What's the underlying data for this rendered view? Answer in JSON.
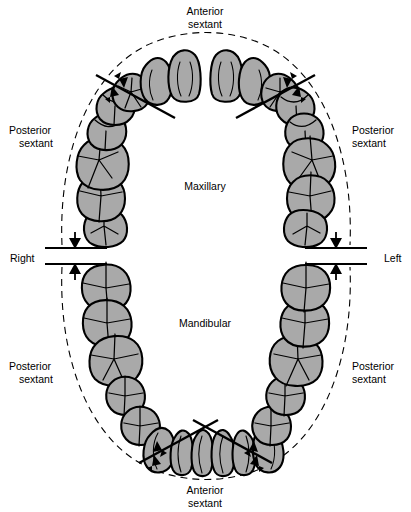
{
  "figure": {
    "title_labels": {
      "top_anterior": "Anterior\nsextant",
      "bottom_anterior": "Anterior\nsextant",
      "maxillary": "Maxillary",
      "mandibular": "Mandibular",
      "right": "Right",
      "left": "Left"
    },
    "labels": {
      "anterior_top_line1": "Anterior",
      "anterior_top_line2": "sextant",
      "anterior_bottom_line1": "Anterior",
      "anterior_bottom_line2": "sextant",
      "maxillary": "Maxillary",
      "mandibular": "Mandibular",
      "right": "Right",
      "left": "Left",
      "post_ul_line1": "Posterior",
      "post_ul_line2": "sextant",
      "post_ur_line1": "Posterior",
      "post_ur_line2": "sextant",
      "post_ll_line1": "Posterior",
      "post_ll_line2": "sextant",
      "post_lr_line1": "Posterior",
      "post_lr_line2": "sextant"
    },
    "colors": {
      "tooth_fill": "#a9a9a9",
      "outline": "#000000",
      "background": "#ffffff"
    },
    "arches": [
      {
        "name": "maxillary",
        "label": "Maxillary",
        "anterior_teeth": 6,
        "posterior_teeth_per_side": 5,
        "total_teeth": 16
      },
      {
        "name": "mandibular",
        "label": "Mandibular",
        "anterior_teeth": 6,
        "posterior_teeth_per_side": 5,
        "total_teeth": 16
      }
    ],
    "sextants": [
      "Maxillary right posterior sextant",
      "Maxillary anterior sextant",
      "Maxillary left posterior sextant",
      "Mandibular right posterior sextant",
      "Mandibular anterior sextant",
      "Mandibular left posterior sextant"
    ]
  }
}
